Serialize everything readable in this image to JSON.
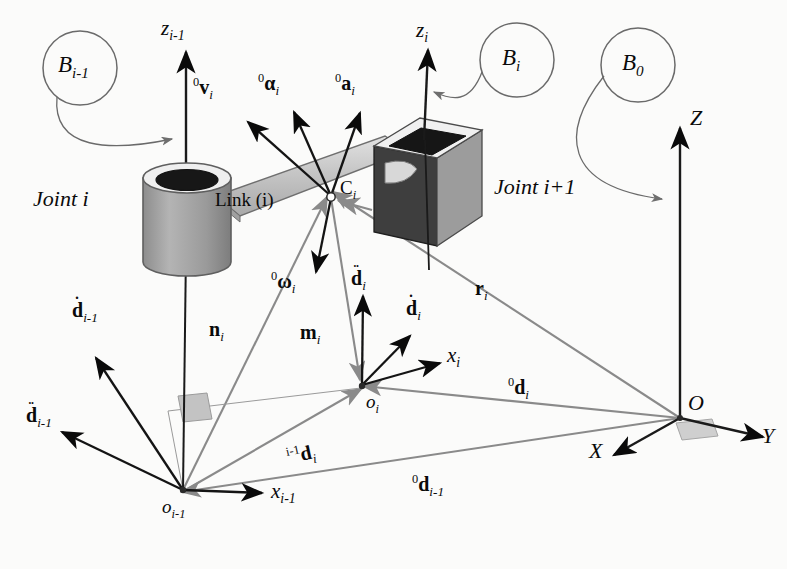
{
  "figure": {
    "domain": "diagram",
    "background_color": "#fbfbfa",
    "ink_color": "#0a0a0a",
    "grey_vector_color": "#808080",
    "body_fill": "#9d9d9d",
    "body_dark": "#3a3a3a",
    "link_fill": "#c9c9c9"
  },
  "bodies": {
    "joint_i_label": "Joint i",
    "joint_i1_label": "Joint i+1",
    "link_label": "Link (i)",
    "com_label": "C",
    "com_sub": "i"
  },
  "frame_tags": [
    {
      "name": "B",
      "sub": "i-1"
    },
    {
      "name": "B",
      "sub": "i"
    },
    {
      "name": "B",
      "sub": "0"
    }
  ],
  "axes": {
    "z_prev": {
      "name": "z",
      "sub": "i-1"
    },
    "z_cur": {
      "name": "z",
      "sub": "i"
    },
    "x_prev": {
      "name": "x",
      "sub": "i-1"
    },
    "x_cur": {
      "name": "x",
      "sub": "i"
    },
    "base_Z": "Z",
    "base_Y": "Y",
    "base_X": "X",
    "base_O": "O"
  },
  "origins": {
    "o_prev": {
      "name": "o",
      "sub": "i-1"
    },
    "o_cur": {
      "name": "o",
      "sub": "i"
    }
  },
  "vectors": [
    {
      "id": "v-i",
      "pre": "0",
      "name": "v",
      "sub": "i",
      "dots": 0,
      "color": "#0a0a0a",
      "desc": "linear velocity of link i in base frame"
    },
    {
      "id": "alpha-i",
      "pre": "0",
      "name": "α",
      "sub": "i",
      "dots": 0,
      "color": "#0a0a0a",
      "desc": "angular acceleration of link i in base frame"
    },
    {
      "id": "a-i",
      "pre": "0",
      "name": "a",
      "sub": "i",
      "dots": 0,
      "color": "#0a0a0a",
      "desc": "linear acceleration of link i in base frame"
    },
    {
      "id": "omega-i",
      "pre": "0",
      "name": "ω",
      "sub": "i",
      "dots": 0,
      "color": "#0a0a0a",
      "desc": "angular velocity of link i in base frame"
    },
    {
      "id": "ddot-d-i",
      "pre": "",
      "name": "d",
      "sub": "i",
      "dots": 2,
      "color": "#0a0a0a",
      "desc": "second time derivative of d_i"
    },
    {
      "id": "dot-d-i",
      "pre": "",
      "name": "d",
      "sub": "i",
      "dots": 1,
      "color": "#0a0a0a",
      "desc": "first time derivative of d_i"
    },
    {
      "id": "dot-d-im1",
      "pre": "",
      "name": "d",
      "sub": "i-1",
      "dots": 1,
      "color": "#0a0a0a",
      "desc": "first time derivative of d_(i-1)"
    },
    {
      "id": "ddot-d-im1",
      "pre": "",
      "name": "d",
      "sub": "i-1",
      "dots": 2,
      "color": "#0a0a0a",
      "desc": "second time derivative of d_(i-1)"
    },
    {
      "id": "n-i",
      "pre": "",
      "name": "n",
      "sub": "i",
      "dots": 0,
      "color": "#808080",
      "desc": "moment vector n_i"
    },
    {
      "id": "m-i",
      "pre": "",
      "name": "m",
      "sub": "i",
      "dots": 0,
      "color": "#808080",
      "desc": "moment vector m_i"
    },
    {
      "id": "r-i",
      "pre": "",
      "name": "r",
      "sub": "i",
      "dots": 0,
      "color": "#808080",
      "desc": "position of C_i from base origin O"
    },
    {
      "id": "d-i-prev",
      "pre": "i-1",
      "name": "d",
      "sub": "i",
      "dots": 0,
      "color": "#808080",
      "desc": "position of o_i expressed in frame i-1"
    },
    {
      "id": "d-i-base",
      "pre": "0",
      "name": "d",
      "sub": "i",
      "dots": 0,
      "color": "#808080",
      "desc": "position of o_i expressed in base frame"
    },
    {
      "id": "d-im1-base",
      "pre": "0",
      "name": "d",
      "sub": "i-1",
      "dots": 0,
      "color": "#808080",
      "desc": "position of o_(i-1) expressed in base frame"
    }
  ]
}
